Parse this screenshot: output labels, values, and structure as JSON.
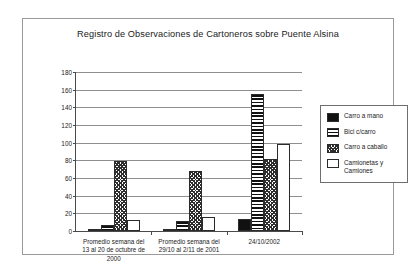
{
  "chart_data": {
    "type": "bar",
    "title": "Registro de Observaciones de Cartoneros sobre Puente Alsina",
    "xlabel": "",
    "ylabel": "",
    "ylim": [
      0,
      180
    ],
    "ytick_step": 20,
    "yticks": [
      180,
      160,
      140,
      120,
      100,
      80,
      60,
      40,
      20,
      0
    ],
    "grid": true,
    "legend_position": "right",
    "categories": [
      "Promedio semana del 13 al 20 de octubre de 2000",
      "Promedio semana del 29/10 al 2/11 de 2001",
      "24/10/2002"
    ],
    "category_lines": [
      [
        "Promedio semana del",
        "13 al 20 de octubre de",
        "2000"
      ],
      [
        "Promedio semana del",
        "29/10 al 2/11 de 2001"
      ],
      [
        "24/10/2002"
      ]
    ],
    "series": [
      {
        "name": "Carro a mano",
        "pattern": "solid-black",
        "values": [
          1,
          2,
          14
        ]
      },
      {
        "name": "Bici c/carro",
        "pattern": "horizontal-stripes",
        "values": [
          7,
          11,
          155
        ]
      },
      {
        "name": "Carro a caballo",
        "pattern": "checkered",
        "values": [
          79,
          68,
          82
        ]
      },
      {
        "name": "Camionetas y Camiones",
        "pattern": "white",
        "values": [
          13,
          16,
          98
        ]
      }
    ]
  },
  "legend": {
    "items": [
      {
        "label": "Carro a mano"
      },
      {
        "label": "Bici c/carro"
      },
      {
        "label": "Carro a caballo"
      },
      {
        "label": "Camionetas y Camiones"
      }
    ]
  }
}
